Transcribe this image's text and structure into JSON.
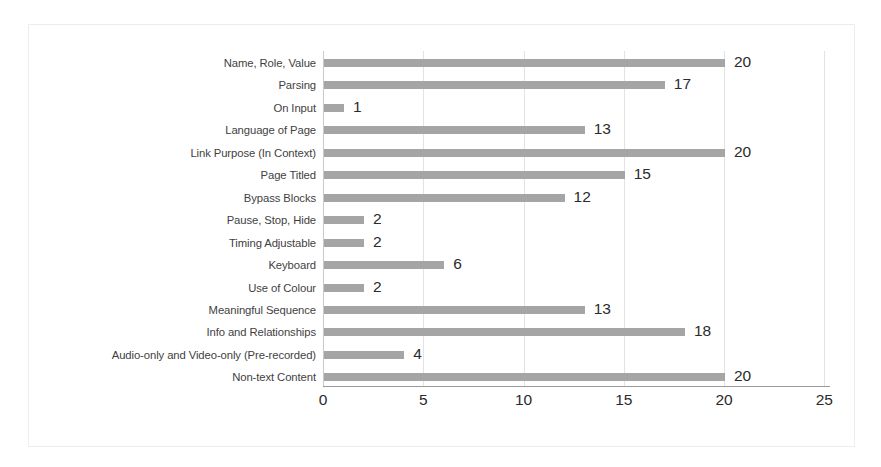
{
  "chart_data": {
    "type": "bar",
    "orientation": "horizontal",
    "title": "",
    "subtitle": "",
    "xlabel": "",
    "ylabel": "",
    "xlim": [
      0,
      25
    ],
    "xticks": [
      "0",
      "5",
      "10",
      "15",
      "20",
      "25"
    ],
    "xtick_values": [
      0,
      5,
      10,
      15,
      20,
      25
    ],
    "grid": "vertical",
    "legend": "none",
    "show_data_labels": true,
    "categories": [
      "Name, Role, Value",
      "Parsing",
      "On Input",
      "Language of Page",
      "Link Purpose (In Context)",
      "Page Titled",
      "Bypass Blocks",
      "Pause, Stop, Hide",
      "Timing Adjustable",
      "Keyboard",
      "Use of Colour",
      "Meaningful Sequence",
      "Info and Relationships",
      "Audio-only and Video-only (Pre-recorded)",
      "Non-text Content"
    ],
    "values": [
      20,
      17,
      1,
      13,
      20,
      15,
      12,
      2,
      2,
      6,
      2,
      13,
      18,
      4,
      20
    ],
    "data_labels": [
      "20",
      "17",
      "1",
      "13",
      "20",
      "15",
      "12",
      "2",
      "2",
      "6",
      "2",
      "13",
      "18",
      "4",
      "20"
    ],
    "bars": [
      {
        "category": "Name, Role, Value",
        "value": 20,
        "label": "20"
      },
      {
        "category": "Parsing",
        "value": 17,
        "label": "17"
      },
      {
        "category": "On Input",
        "value": 1,
        "label": "1"
      },
      {
        "category": "Language of Page",
        "value": 13,
        "label": "13"
      },
      {
        "category": "Link Purpose (In Context)",
        "value": 20,
        "label": "20"
      },
      {
        "category": "Page Titled",
        "value": 15,
        "label": "15"
      },
      {
        "category": "Bypass Blocks",
        "value": 12,
        "label": "12"
      },
      {
        "category": "Pause, Stop, Hide",
        "value": 2,
        "label": "2"
      },
      {
        "category": "Timing Adjustable",
        "value": 2,
        "label": "2"
      },
      {
        "category": "Keyboard",
        "value": 6,
        "label": "6"
      },
      {
        "category": "Use of Colour",
        "value": 2,
        "label": "2"
      },
      {
        "category": "Meaningful Sequence",
        "value": 13,
        "label": "13"
      },
      {
        "category": "Info and Relationships",
        "value": 18,
        "label": "18"
      },
      {
        "category": "Audio-only and Video-only (Pre-recorded)",
        "value": 4,
        "label": "4"
      },
      {
        "category": "Non-text Content",
        "value": 20,
        "label": "20"
      }
    ],
    "colors": {
      "bar": "#a5a5a5",
      "grid": "#e3e3e6",
      "axis": "#9a9a9d",
      "frame_border": "#ededf0",
      "category_label_text": "#3f3f3f",
      "value_label_text": "#2b2b2b",
      "plot_background": "#ffffff"
    }
  }
}
